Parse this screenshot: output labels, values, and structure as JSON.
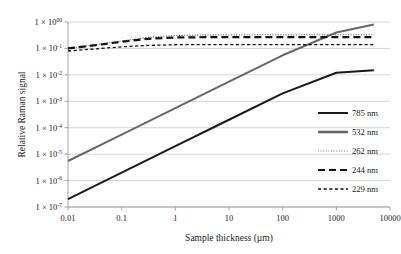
{
  "chart_data": {
    "type": "line",
    "title": "",
    "xlabel": "Sample thickness (µm)",
    "ylabel": "Relative Raman signal",
    "xscale": "log",
    "yscale": "log",
    "xlim": [
      0.01,
      10000
    ],
    "ylim": [
      1e-07,
      1
    ],
    "grid": true,
    "grid_axis": "y",
    "legend_position": "right",
    "xticks": [
      "0.01",
      "0.1",
      "1",
      "10",
      "100",
      "1000",
      "10000"
    ],
    "xtick_values": [
      0.01,
      0.1,
      1,
      10,
      100,
      1000,
      10000
    ],
    "yticks": [
      {
        "mantissa": "1 × 10",
        "exponent": "00",
        "value": 1
      },
      {
        "mantissa": "1 × 10",
        "exponent": "-1",
        "value": 0.1
      },
      {
        "mantissa": "1 × 10",
        "exponent": "-2",
        "value": 0.01
      },
      {
        "mantissa": "1 × 10",
        "exponent": "-3",
        "value": 0.001
      },
      {
        "mantissa": "1 × 10",
        "exponent": "-4",
        "value": 0.0001
      },
      {
        "mantissa": "1 × 10",
        "exponent": "-5",
        "value": 1e-05
      },
      {
        "mantissa": "1 × 10",
        "exponent": "-6",
        "value": 1e-06
      },
      {
        "mantissa": "1 × 10",
        "exponent": "-7",
        "value": 1e-07
      }
    ],
    "series": [
      {
        "name": "785 nm",
        "color": "#1a1a1a",
        "width": 2.0,
        "dash": "none",
        "x": [
          0.01,
          0.1,
          1,
          10,
          100,
          1000,
          5000
        ],
        "y": [
          2e-07,
          2e-06,
          2e-05,
          0.0002,
          0.002,
          0.012,
          0.015
        ]
      },
      {
        "name": "532 nm",
        "color": "#676767",
        "width": 2.0,
        "dash": "none",
        "x": [
          0.01,
          0.1,
          1,
          10,
          100,
          1000,
          5000
        ],
        "y": [
          5.5e-06,
          5.5e-05,
          0.00055,
          0.0055,
          0.055,
          0.4,
          0.8
        ]
      },
      {
        "name": "262 nm",
        "color": "#555555",
        "width": 1.1,
        "dash": "1,1.6",
        "x": [
          0.01,
          0.03,
          0.1,
          0.3,
          1,
          10,
          100,
          1000,
          5000
        ],
        "y": [
          0.1,
          0.135,
          0.19,
          0.26,
          0.31,
          0.33,
          0.33,
          0.33,
          0.33
        ]
      },
      {
        "name": "244 nm",
        "color": "#111111",
        "width": 2.2,
        "dash": "7,4",
        "x": [
          0.01,
          0.03,
          0.1,
          0.3,
          1,
          10,
          100,
          1000,
          5000
        ],
        "y": [
          0.1,
          0.13,
          0.18,
          0.23,
          0.26,
          0.27,
          0.27,
          0.27,
          0.27
        ]
      },
      {
        "name": "229 nm",
        "color": "#111111",
        "width": 1.3,
        "dash": "3.2,2.4",
        "x": [
          0.01,
          0.03,
          0.1,
          0.3,
          1,
          10,
          100,
          1000,
          5000
        ],
        "y": [
          0.08,
          0.095,
          0.115,
          0.13,
          0.138,
          0.14,
          0.14,
          0.14,
          0.14
        ]
      }
    ],
    "legend": [
      {
        "label": "785 nm",
        "color": "#1a1a1a",
        "width": 2.0,
        "dash": "none"
      },
      {
        "label": "532 nm",
        "color": "#676767",
        "width": 2.6,
        "dash": "none"
      },
      {
        "label": "262 nm",
        "color": "#777777",
        "width": 1.1,
        "dash": "1,1.6"
      },
      {
        "label": "244 nm",
        "color": "#111111",
        "width": 2.2,
        "dash": "7,4"
      },
      {
        "label": "229 nm",
        "color": "#111111",
        "width": 1.3,
        "dash": "3.2,2.4"
      }
    ]
  },
  "style": {
    "grid_color": "#c9c9c9",
    "axis_color": "#9a9a9a",
    "background": "#ffffff"
  }
}
